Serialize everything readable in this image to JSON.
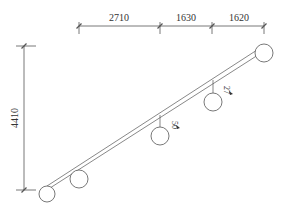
{
  "diagram": {
    "type": "cable-layout",
    "colors": {
      "line": "#555555",
      "text": "#333333"
    },
    "horizontal_dimensions": [
      {
        "label": "2710",
        "x1": 79,
        "x2": 160
      },
      {
        "label": "1630",
        "x1": 160,
        "x2": 212
      },
      {
        "label": "1620",
        "x1": 212,
        "x2": 264
      }
    ],
    "vertical_dimension": {
      "label": "4410",
      "y1": 46,
      "y2": 190
    },
    "nodes": [
      {
        "id": "n1",
        "cx": 47,
        "cy": 194,
        "r": 8
      },
      {
        "id": "n2",
        "cx": 79,
        "cy": 179,
        "r": 9
      },
      {
        "id": "n3",
        "cx": 160,
        "cy": 136,
        "r": 9,
        "label": "50"
      },
      {
        "id": "n4",
        "cx": 213,
        "cy": 102,
        "r": 9,
        "label": "27"
      },
      {
        "id": "n5",
        "cx": 264,
        "cy": 53,
        "r": 9
      }
    ]
  }
}
